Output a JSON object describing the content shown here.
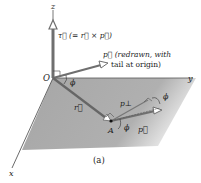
{
  "figure": {
    "caption": "(a)",
    "axes": {
      "x": "x",
      "y": "y",
      "z": "z"
    },
    "origin_label": "O",
    "point_label": "A",
    "torque_label": "τ⃗ (= r⃗ × p⃗)",
    "p_redrawn_label_line1": "p⃗ (redrawn, with",
    "p_redrawn_label_line2": "tail at origin)",
    "r_label": "r⃗",
    "p_label": "p⃗",
    "p_perp_label": "p⊥",
    "angle_label": "ϕ",
    "colors": {
      "plane": "#a9a9a9",
      "vector": "#6f6f6f",
      "axis": "#555555",
      "text": "#222222"
    }
  }
}
